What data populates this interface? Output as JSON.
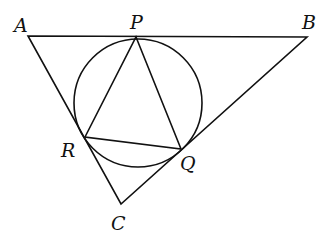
{
  "diagram": {
    "labels": {
      "A": "A",
      "B": "B",
      "C": "C",
      "P": "P",
      "Q": "Q",
      "R": "R"
    },
    "points": {
      "A": [
        28,
        36
      ],
      "B": [
        307,
        37
      ],
      "C": [
        121,
        204
      ],
      "P": [
        136,
        37
      ],
      "Q": [
        181,
        149
      ],
      "R": [
        85,
        137
      ]
    },
    "circle": {
      "cx": 138,
      "cy": 103,
      "r": 64
    },
    "stroke_color": "#111111"
  }
}
